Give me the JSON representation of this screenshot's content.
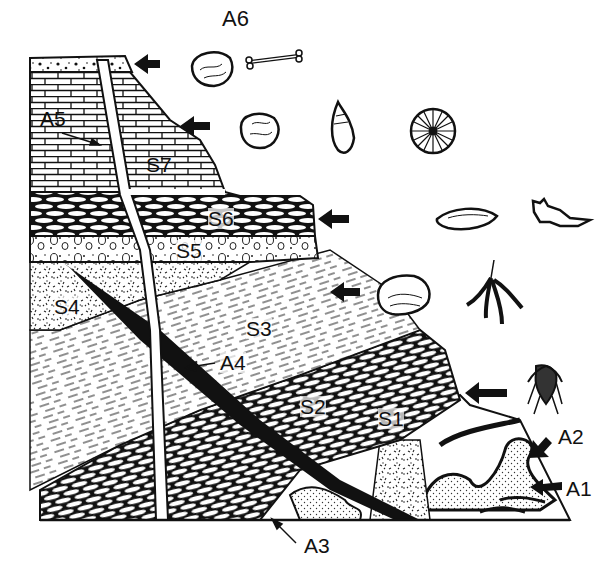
{
  "diagram": {
    "type": "geologic cross-section with fossil succession",
    "colors": {
      "ink": "#111111",
      "paper": "#ffffff"
    },
    "strata": [
      {
        "id": "S1",
        "label": "S1",
        "pattern": "dashed lamination (partial)"
      },
      {
        "id": "S2",
        "label": "S2",
        "pattern": "oval limestone blocks"
      },
      {
        "id": "S3",
        "label": "S3",
        "pattern": "dashed shale"
      },
      {
        "id": "S4",
        "label": "S4",
        "pattern": "speckled sandstone"
      },
      {
        "id": "S5",
        "label": "S5",
        "pattern": "conglomerate pebbles"
      },
      {
        "id": "S6",
        "label": "S6",
        "pattern": "oval blocks"
      },
      {
        "id": "S7",
        "label": "S7",
        "pattern": "brick limestone"
      }
    ],
    "annotations": [
      {
        "id": "A1",
        "label": "A1",
        "meaning": "folded basement rocks"
      },
      {
        "id": "A2",
        "label": "A2",
        "meaning": "folded sediments"
      },
      {
        "id": "A3",
        "label": "A3",
        "meaning": "intrusion base"
      },
      {
        "id": "A4",
        "label": "A4",
        "meaning": "dark dike / fault"
      },
      {
        "id": "A5",
        "label": "A5",
        "meaning": "light dike"
      },
      {
        "id": "A6",
        "label": "A6",
        "meaning": "top soil / youngest layer"
      }
    ],
    "fossils": [
      {
        "row": "A6-level",
        "items": [
          "clam shell",
          "bone"
        ]
      },
      {
        "row": "S7-level",
        "items": [
          "clam shell",
          "spiral snail",
          "sand dollar"
        ]
      },
      {
        "row": "S6-level",
        "items": [
          "leaf-shaped shell",
          "jaw fragment"
        ]
      },
      {
        "row": "S3-level",
        "items": [
          "brachiopod",
          "graptolite"
        ]
      },
      {
        "row": "S1-level",
        "items": [
          "trilobite"
        ]
      }
    ]
  }
}
